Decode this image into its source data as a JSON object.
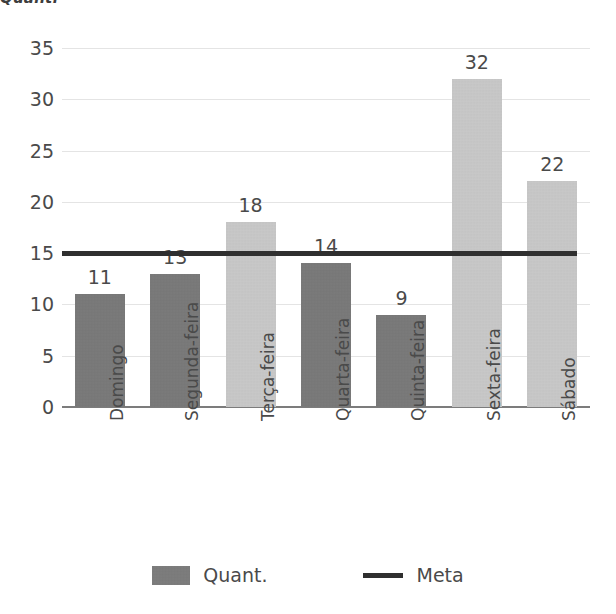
{
  "page": {
    "clipped_header_text": "Quant."
  },
  "chart_data": {
    "type": "bar",
    "title": "",
    "xlabel": "",
    "ylabel": "",
    "categories": [
      "Domingo",
      "Segunda-feira",
      "Terça-feira",
      "Quarta-feira",
      "Quinta-feira",
      "Sexta-feira",
      "Sábado"
    ],
    "series": [
      {
        "name": "Quant.",
        "type": "bar",
        "values": [
          11,
          13,
          18,
          14,
          9,
          32,
          22
        ],
        "data_labels": [
          "11",
          "13",
          "18",
          "14",
          "9",
          "32",
          "22"
        ],
        "bar_colors": [
          "#757575",
          "#757575",
          "#cbcbcb",
          "#757575",
          "#757575",
          "#cbcbcb",
          "#cbcbcb"
        ]
      },
      {
        "name": "Meta",
        "type": "line",
        "value": 15,
        "color": "#2f2f2f"
      }
    ],
    "ylim": [
      0,
      35
    ],
    "yticks": [
      0,
      5,
      10,
      15,
      20,
      25,
      30,
      35
    ],
    "ytick_labels": [
      "0",
      "5",
      "10",
      "15",
      "20",
      "25",
      "30",
      "35"
    ],
    "grid": true,
    "grid_color": "#e4e4e4",
    "legend_position": "bottom",
    "legend": [
      {
        "label": "Quant.",
        "marker": "square",
        "color": "#787878"
      },
      {
        "label": "Meta",
        "marker": "line",
        "color": "#2f2f2f"
      }
    ]
  }
}
